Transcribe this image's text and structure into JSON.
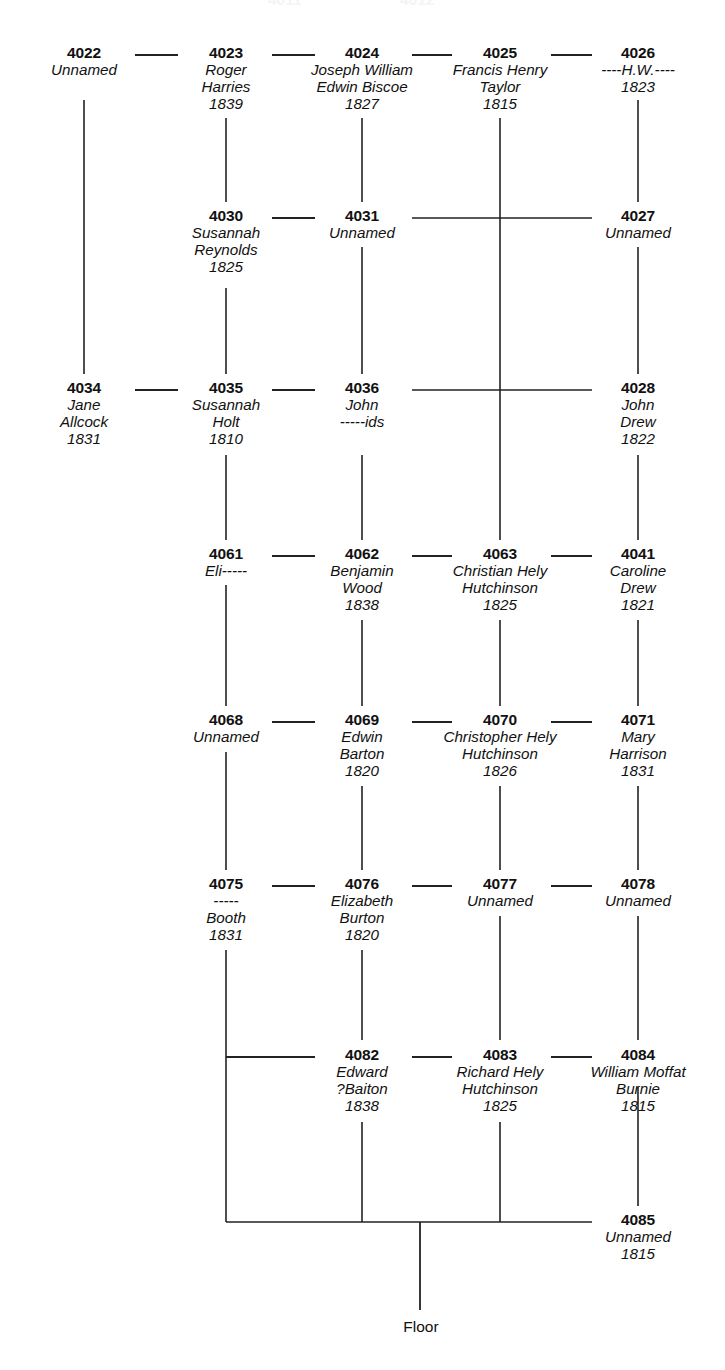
{
  "diagram": {
    "background_color": "#ffffff",
    "line_color": "#222222",
    "text_color": "#111111",
    "floor_label": "Floor",
    "columns": [
      {
        "key": "c0",
        "x": 84
      },
      {
        "key": "c1",
        "x": 226
      },
      {
        "key": "c2",
        "x": 362
      },
      {
        "key": "c3",
        "x": 500
      },
      {
        "key": "c4",
        "x": 638
      }
    ],
    "rows": [
      {
        "key": "r0",
        "y": 55
      },
      {
        "key": "r1",
        "y": 218
      },
      {
        "key": "r2",
        "y": 390
      },
      {
        "key": "r3",
        "y": 556
      },
      {
        "key": "r4",
        "y": 722
      },
      {
        "key": "r5",
        "y": 886
      },
      {
        "key": "r6",
        "y": 1057
      },
      {
        "key": "r7",
        "y": 1222
      }
    ],
    "nodes": [
      {
        "id": "4022",
        "col": 0,
        "row": 0,
        "lines": [
          "Unnamed"
        ]
      },
      {
        "id": "4023",
        "col": 1,
        "row": 0,
        "lines": [
          "Roger",
          "Harries",
          "1839"
        ]
      },
      {
        "id": "4024",
        "col": 2,
        "row": 0,
        "lines": [
          "Joseph William",
          "Edwin Biscoe",
          "1827"
        ]
      },
      {
        "id": "4025",
        "col": 3,
        "row": 0,
        "lines": [
          "Francis Henry",
          "Taylor",
          "1815"
        ]
      },
      {
        "id": "4026",
        "col": 4,
        "row": 0,
        "lines": [
          "----H.W.----",
          "1823"
        ]
      },
      {
        "id": "4030",
        "col": 1,
        "row": 1,
        "lines": [
          "Susannah",
          "Reynolds",
          "1825"
        ]
      },
      {
        "id": "4031",
        "col": 2,
        "row": 1,
        "lines": [
          "Unnamed"
        ]
      },
      {
        "id": "4027",
        "col": 4,
        "row": 1,
        "lines": [
          "Unnamed"
        ]
      },
      {
        "id": "4034",
        "col": 0,
        "row": 2,
        "lines": [
          "Jane",
          "Allcock",
          "1831"
        ]
      },
      {
        "id": "4035",
        "col": 1,
        "row": 2,
        "lines": [
          "Susannah",
          "Holt",
          "1810"
        ]
      },
      {
        "id": "4036",
        "col": 2,
        "row": 2,
        "lines": [
          "John",
          "-----ids"
        ]
      },
      {
        "id": "4028",
        "col": 4,
        "row": 2,
        "lines": [
          "John",
          "Drew",
          "1822"
        ]
      },
      {
        "id": "4061",
        "col": 1,
        "row": 3,
        "lines": [
          "Eli-----"
        ]
      },
      {
        "id": "4062",
        "col": 2,
        "row": 3,
        "lines": [
          "Benjamin",
          "Wood",
          "1838"
        ]
      },
      {
        "id": "4063",
        "col": 3,
        "row": 3,
        "lines": [
          "Christian Hely",
          "Hutchinson",
          "1825"
        ]
      },
      {
        "id": "4041",
        "col": 4,
        "row": 3,
        "lines": [
          "Caroline",
          "Drew",
          "1821"
        ]
      },
      {
        "id": "4068",
        "col": 1,
        "row": 4,
        "lines": [
          "Unnamed"
        ]
      },
      {
        "id": "4069",
        "col": 2,
        "row": 4,
        "lines": [
          "Edwin",
          "Barton",
          "1820"
        ]
      },
      {
        "id": "4070",
        "col": 3,
        "row": 4,
        "lines": [
          "Christopher Hely",
          "Hutchinson",
          "1826"
        ]
      },
      {
        "id": "4071",
        "col": 4,
        "row": 4,
        "lines": [
          "Mary",
          "Harrison",
          "1831"
        ]
      },
      {
        "id": "4075",
        "col": 1,
        "row": 5,
        "lines": [
          "-----",
          "Booth",
          "1831"
        ]
      },
      {
        "id": "4076",
        "col": 2,
        "row": 5,
        "lines": [
          "Elizabeth",
          "Burton",
          "1820"
        ]
      },
      {
        "id": "4077",
        "col": 3,
        "row": 5,
        "lines": [
          "Unnamed"
        ]
      },
      {
        "id": "4078",
        "col": 4,
        "row": 5,
        "lines": [
          "Unnamed"
        ]
      },
      {
        "id": "4082",
        "col": 2,
        "row": 6,
        "lines": [
          "Edward",
          "?Baiton",
          "1838"
        ]
      },
      {
        "id": "4083",
        "col": 3,
        "row": 6,
        "lines": [
          "Richard Hely",
          "Hutchinson",
          "1825"
        ]
      },
      {
        "id": "4084",
        "col": 4,
        "row": 6,
        "lines": [
          "William Moffat",
          "Burnie",
          "1815"
        ]
      },
      {
        "id": "4085",
        "col": 4,
        "row": 7,
        "lines": [
          "Unnamed",
          "1815"
        ]
      }
    ],
    "edges": {
      "horizontal": [
        {
          "y": 55,
          "x1": 135,
          "x2": 178
        },
        {
          "y": 55,
          "x1": 272,
          "x2": 315
        },
        {
          "y": 55,
          "x1": 412,
          "x2": 452
        },
        {
          "y": 55,
          "x1": 551,
          "x2": 592
        },
        {
          "y": 218,
          "x1": 272,
          "x2": 315
        },
        {
          "y": 218,
          "x1": 412,
          "x2": 592
        },
        {
          "y": 390,
          "x1": 135,
          "x2": 178
        },
        {
          "y": 390,
          "x1": 272,
          "x2": 315
        },
        {
          "y": 390,
          "x1": 412,
          "x2": 592
        },
        {
          "y": 556,
          "x1": 272,
          "x2": 315
        },
        {
          "y": 556,
          "x1": 412,
          "x2": 452
        },
        {
          "y": 556,
          "x1": 551,
          "x2": 592
        },
        {
          "y": 722,
          "x1": 272,
          "x2": 315
        },
        {
          "y": 722,
          "x1": 412,
          "x2": 452
        },
        {
          "y": 722,
          "x1": 551,
          "x2": 592
        },
        {
          "y": 886,
          "x1": 272,
          "x2": 315
        },
        {
          "y": 886,
          "x1": 412,
          "x2": 452
        },
        {
          "y": 886,
          "x1": 551,
          "x2": 592
        },
        {
          "y": 1057,
          "x1": 226,
          "x2": 315
        },
        {
          "y": 1057,
          "x1": 412,
          "x2": 452
        },
        {
          "y": 1057,
          "x1": 551,
          "x2": 592
        },
        {
          "y": 1222,
          "x1": 226,
          "x2": 592
        }
      ],
      "vertical": [
        {
          "x": 84,
          "y1": 100,
          "y2": 374
        },
        {
          "x": 226,
          "y1": 118,
          "y2": 202
        },
        {
          "x": 362,
          "y1": 118,
          "y2": 202
        },
        {
          "x": 500,
          "y1": 118,
          "y2": 540
        },
        {
          "x": 638,
          "y1": 100,
          "y2": 202
        },
        {
          "x": 226,
          "y1": 288,
          "y2": 374
        },
        {
          "x": 362,
          "y1": 247,
          "y2": 374
        },
        {
          "x": 638,
          "y1": 247,
          "y2": 374
        },
        {
          "x": 226,
          "y1": 455,
          "y2": 540
        },
        {
          "x": 362,
          "y1": 455,
          "y2": 540
        },
        {
          "x": 638,
          "y1": 455,
          "y2": 540
        },
        {
          "x": 226,
          "y1": 585,
          "y2": 706
        },
        {
          "x": 362,
          "y1": 620,
          "y2": 706
        },
        {
          "x": 500,
          "y1": 620,
          "y2": 706
        },
        {
          "x": 638,
          "y1": 620,
          "y2": 706
        },
        {
          "x": 226,
          "y1": 752,
          "y2": 870
        },
        {
          "x": 362,
          "y1": 786,
          "y2": 870
        },
        {
          "x": 500,
          "y1": 786,
          "y2": 870
        },
        {
          "x": 638,
          "y1": 786,
          "y2": 870
        },
        {
          "x": 226,
          "y1": 950,
          "y2": 1222
        },
        {
          "x": 362,
          "y1": 950,
          "y2": 1040
        },
        {
          "x": 500,
          "y1": 916,
          "y2": 1040
        },
        {
          "x": 638,
          "y1": 916,
          "y2": 1040
        },
        {
          "x": 362,
          "y1": 1122,
          "y2": 1222
        },
        {
          "x": 500,
          "y1": 1122,
          "y2": 1222
        },
        {
          "x": 638,
          "y1": 1087,
          "y2": 1206
        }
      ],
      "floor_stem": {
        "x": 420,
        "y1": 1222,
        "y2": 1310
      }
    },
    "floor_label_pos": {
      "x": 421,
      "y": 1318
    },
    "ghost_fragments": [
      {
        "x": 268,
        "text": "4011"
      },
      {
        "x": 400,
        "text": "4012"
      }
    ]
  }
}
